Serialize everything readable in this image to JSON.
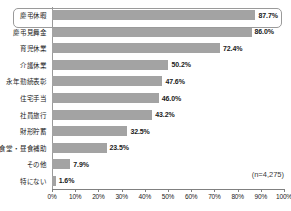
{
  "chart_data": {
    "type": "bar",
    "orientation": "horizontal",
    "title": "",
    "subtitle": "",
    "xlabel": "",
    "ylabel": "",
    "xlim": [
      0,
      100
    ],
    "grid": false,
    "legend": null,
    "categories": [
      "慶弔休暇",
      "慶弔見舞金",
      "育児休業",
      "介護休業",
      "永年勤続表彰",
      "住宅手当",
      "社員旅行",
      "財形貯蓄",
      "食堂・昼食補助",
      "その他",
      "特にない"
    ],
    "values": [
      87.7,
      86.0,
      72.4,
      50.2,
      47.6,
      46.0,
      43.2,
      32.5,
      23.5,
      7.9,
      1.6
    ],
    "value_labels": [
      "87.7%",
      "86.0%",
      "72.4%",
      "50.2%",
      "47.6%",
      "46.0%",
      "43.2%",
      "32.5%",
      "23.5%",
      "7.9%",
      "1.6%"
    ],
    "tick_values": [
      0,
      10,
      20,
      30,
      40,
      50,
      60,
      70,
      80,
      90,
      100
    ],
    "tick_labels": [
      "0%",
      "10%",
      "20%",
      "30%",
      "40%",
      "50%",
      "60%",
      "70%",
      "80%",
      "90%",
      "100%"
    ],
    "annotations": {
      "sample_size": "(n=4,275)"
    },
    "highlighted_category_index": 0,
    "colors": {
      "bar_fill": "#a3a3a3",
      "axis": "#808080",
      "text": "#1a1a1a",
      "highlight_border": "#9a9a9a",
      "background": "#ffffff"
    }
  }
}
